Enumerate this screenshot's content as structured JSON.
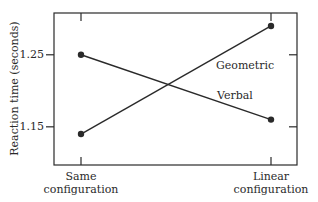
{
  "chart_data": {
    "type": "line",
    "title": "",
    "xlabel": "",
    "ylabel": "Reaction time (seconds)",
    "categories": [
      "Same configuration",
      "Linear configuration"
    ],
    "category_lines": [
      [
        "Same",
        "configuration"
      ],
      [
        "Linear",
        "configuration"
      ]
    ],
    "series": [
      {
        "name": "Geometric",
        "values": [
          1.14,
          1.29
        ]
      },
      {
        "name": "Verbal",
        "values": [
          1.25,
          1.16
        ]
      }
    ],
    "yticks": [
      1.15,
      1.25
    ],
    "ytick_labels": [
      "1.15",
      "1.25"
    ],
    "ylim": [
      1.097,
      1.308
    ],
    "grid": false,
    "legend": "inline labels near lines",
    "line_color": "#2a2a2a"
  }
}
